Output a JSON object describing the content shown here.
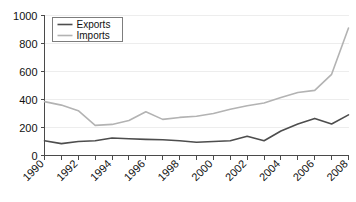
{
  "chart_data": {
    "type": "line",
    "title": "",
    "subtitle": "",
    "xlabel": "",
    "ylabel": "",
    "x": [
      1990,
      1991,
      1992,
      1993,
      1994,
      1995,
      1996,
      1997,
      1998,
      1999,
      2000,
      2001,
      2002,
      2003,
      2004,
      2005,
      2006,
      2007,
      2008
    ],
    "xlim": [
      1990,
      2008
    ],
    "ylim": [
      0,
      1000
    ],
    "yticks": [
      0,
      200,
      400,
      600,
      800,
      1000
    ],
    "ytick_labels": [
      "0",
      "200",
      "400",
      "600",
      "800",
      "1000"
    ],
    "xticks": [
      1990,
      1991,
      1992,
      1993,
      1994,
      1995,
      1996,
      1997,
      1998,
      1999,
      2000,
      2001,
      2002,
      2003,
      2004,
      2005,
      2006,
      2007,
      2008
    ],
    "xtick_labels": [
      "1990",
      "",
      "1992",
      "",
      "1994",
      "",
      "1996",
      "",
      "1998",
      "",
      "2000",
      "",
      "2002",
      "",
      "2004",
      "",
      "2006",
      "",
      "2008"
    ],
    "grid": true,
    "grid_axis": "y",
    "legend_position": "top-left",
    "series": [
      {
        "name": "Exports",
        "color": "#4d4d4d",
        "values": [
          105,
          85,
          100,
          105,
          125,
          120,
          115,
          112,
          105,
          95,
          100,
          105,
          138,
          105,
          175,
          225,
          265,
          225,
          290
        ]
      },
      {
        "name": "Imports",
        "color": "#b3b3b3",
        "values": [
          385,
          360,
          320,
          215,
          222,
          250,
          312,
          258,
          272,
          280,
          300,
          330,
          355,
          375,
          415,
          450,
          465,
          580,
          910
        ]
      }
    ]
  },
  "legend": {
    "items": [
      {
        "label": "Exports"
      },
      {
        "label": "Imports"
      }
    ]
  },
  "colors": {
    "exports": "#4d4d4d",
    "imports": "#b3b3b3",
    "grid": "#ededed",
    "axis": "#4a4a4a",
    "background": "#ffffff",
    "text": "#111111"
  }
}
